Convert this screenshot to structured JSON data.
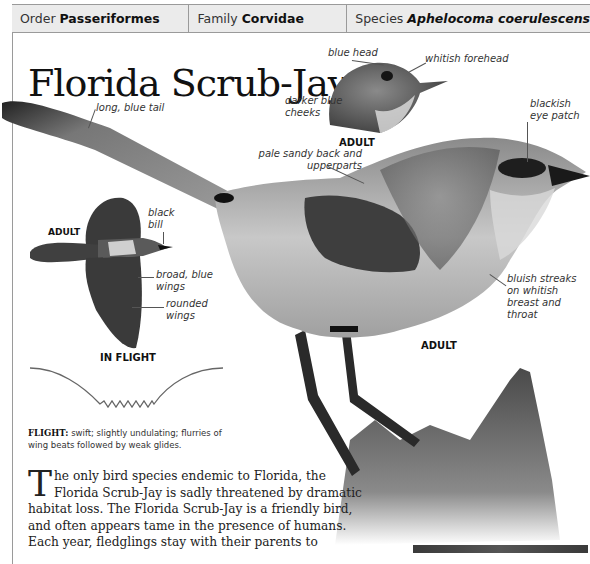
{
  "header": {
    "order_label": "Order",
    "order_value": "Passeriformes",
    "family_label": "Family",
    "family_value": "Corvidae",
    "species_label": "Species",
    "species_value": "Aphelocoma coerulescens"
  },
  "title": "Florida Scrub-Jay",
  "head_inset": {
    "callouts": {
      "blue_head": "blue head",
      "whitish_forehead": "whitish forehead",
      "darker_blue_cheeks": "darker blue cheeks"
    },
    "tag": "ADULT"
  },
  "main_bird": {
    "callouts": {
      "long_blue_tail": "long, blue tail",
      "pale_sandy_back": "pale sandy back and upperparts",
      "blackish_eye_patch": "blackish eye patch",
      "bluish_streaks": "bluish streaks on whitish breast and throat"
    },
    "tag": "ADULT"
  },
  "flight_inset": {
    "tag": "ADULT",
    "callouts": {
      "black_bill": "black bill",
      "broad_blue_wings": "broad, blue wings",
      "rounded_wings": "rounded wings"
    },
    "caption": "IN FLIGHT"
  },
  "flight_description": {
    "label": "FLIGHT:",
    "text": " swift; slightly undulating; flurries of wing beats followed by weak glides."
  },
  "body": {
    "dropcap": "T",
    "text": "he only bird species endemic to Florida, the Florida Scrub-Jay is sadly threatened by dramatic habitat loss. The Florida Scrub-Jay is a friendly bird, and often appears tame in the presence of humans. Each year, fledglings stay with their parents to"
  },
  "colors": {
    "header_bg": "#ebebeb",
    "border": "#9a9a9a",
    "bird_dark": "#3c3c3c",
    "bird_mid": "#7a7a7a",
    "bird_light": "#cfcfcf"
  }
}
